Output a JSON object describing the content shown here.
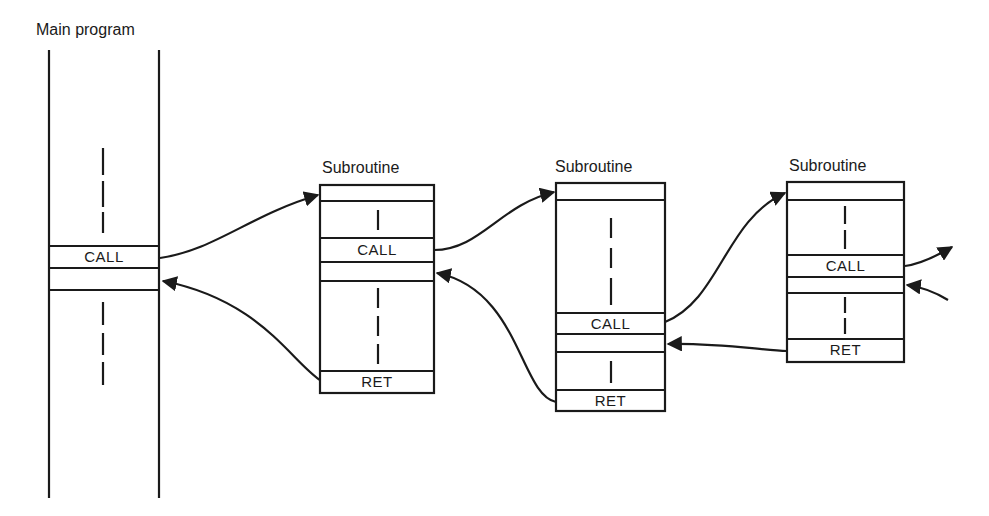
{
  "diagram": {
    "type": "nested-subroutine-calls",
    "main_program": {
      "title": "Main program",
      "call_label": "CALL"
    },
    "subroutines": [
      {
        "title": "Subroutine",
        "call_label": "CALL",
        "ret_label": "RET"
      },
      {
        "title": "Subroutine",
        "call_label": "CALL",
        "ret_label": "RET"
      },
      {
        "title": "Subroutine",
        "call_label": "CALL",
        "ret_label": "RET"
      }
    ],
    "arrows": [
      {
        "from": "Main program CALL",
        "to": "Subroutine 1 entry"
      },
      {
        "from": "Subroutine 1 RET",
        "to": "Main program return point"
      },
      {
        "from": "Subroutine 1 CALL",
        "to": "Subroutine 2 entry"
      },
      {
        "from": "Subroutine 2 RET",
        "to": "Subroutine 1 return point"
      },
      {
        "from": "Subroutine 2 CALL",
        "to": "Subroutine 3 entry"
      },
      {
        "from": "Subroutine 3 RET",
        "to": "Subroutine 2 return point"
      },
      {
        "from": "Subroutine 3 CALL",
        "to": "next (off-diagram)"
      },
      {
        "from": "next (off-diagram)",
        "to": "Subroutine 3 return point"
      }
    ],
    "stroke_color": "#1a1a1a",
    "background": "#ffffff"
  }
}
